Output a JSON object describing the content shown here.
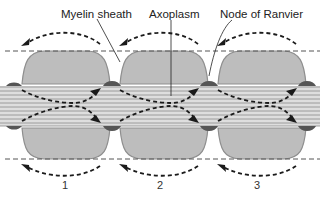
{
  "diagram": {
    "labels": {
      "myelin_sheath": "Myelin sheath",
      "axoplasm": "Axoplasm",
      "node_of_ranvier": "Node of Ranvier"
    },
    "segment_numbers": [
      "1",
      "2",
      "3"
    ],
    "colors": {
      "myelin_fill": "#bdbdbd",
      "myelin_outline": "#9a9a9a",
      "node_fill": "#555555",
      "axon_fill": "#d9d9d9",
      "axon_lines": "#8a8a8a",
      "arrow": "#1a1a1a",
      "membrane_dashes": "#555555"
    }
  }
}
